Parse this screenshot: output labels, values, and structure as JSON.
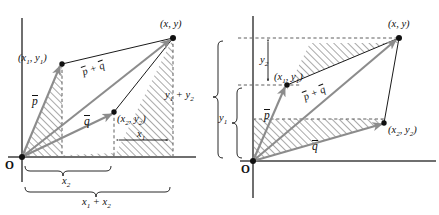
{
  "figure": {
    "type": "vector-addition-diagram",
    "panels": [
      {
        "id": "left",
        "name": "component-sum-x-axis-panel",
        "origin_label": "O",
        "points": [
          {
            "name": "p-head",
            "label_html": "(x<sub>1</sub>, y<sub>1</sub>)",
            "text": "(x1, y1)"
          },
          {
            "name": "q-head",
            "label_html": "(x<sub>2</sub>, y<sub>2</sub>)",
            "text": "(x2, y2)"
          },
          {
            "name": "sum-head",
            "label_html": "(x, y)",
            "text": "(x, y)"
          }
        ],
        "vectors": [
          {
            "name": "vector-p",
            "label": "p",
            "overbar": true
          },
          {
            "name": "vector-q",
            "label": "q",
            "overbar": true
          },
          {
            "name": "vector-p-plus-q",
            "label": "p + q",
            "overbar": true
          }
        ],
        "measures": [
          {
            "name": "measure-x1",
            "label_html": "x<sub>1</sub>",
            "text": "x1",
            "style": "double-arrow"
          },
          {
            "name": "measure-x2",
            "label_html": "x<sub>2</sub>",
            "text": "x2",
            "style": "brace"
          },
          {
            "name": "measure-x1-plus-x2",
            "label_html": "x<sub>1</sub> + x<sub>2</sub>",
            "text": "x1 + x2",
            "style": "brace"
          }
        ]
      },
      {
        "id": "right",
        "name": "component-sum-y-axis-panel",
        "origin_label": "O",
        "points": [
          {
            "name": "p-head",
            "label_html": "(x<sub>1</sub>, y<sub>1</sub>)",
            "text": "(x1, y1)"
          },
          {
            "name": "q-head",
            "label_html": "(x<sub>2</sub>, y<sub>2</sub>)",
            "text": "(x2, y2)"
          },
          {
            "name": "sum-head",
            "label_html": "(x, y)",
            "text": "(x, y)"
          }
        ],
        "vectors": [
          {
            "name": "vector-p",
            "label": "p",
            "overbar": true
          },
          {
            "name": "vector-q",
            "label": "q",
            "overbar": true
          },
          {
            "name": "vector-p-plus-q",
            "label": "p + q",
            "overbar": true
          }
        ],
        "measures": [
          {
            "name": "measure-y2",
            "label_html": "y<sub>2</sub>",
            "text": "y2",
            "style": "double-arrow"
          },
          {
            "name": "measure-y1",
            "label_html": "y<sub>1</sub>",
            "text": "y1",
            "style": "brace"
          },
          {
            "name": "measure-y1-plus-y2",
            "label_html": "y<sub>1</sub> + y<sub>2</sub>",
            "text": "y1 + y2",
            "style": "brace"
          }
        ]
      }
    ],
    "colors": {
      "axis": "#6f6f6f",
      "vector_arrow": "#8c8c8c",
      "outline": "#1a1a1a",
      "hatch": "#5a5a5a",
      "dashed": "#4d4d4d",
      "background": "#ffffff"
    }
  },
  "labels": {
    "origin": "O",
    "left": {
      "p1": "(x",
      "p1b": "1",
      "p1c": ", y",
      "p1d": "1",
      "p1e": ")",
      "xy": "(x, y)",
      "x1": "x",
      "x1s": "1",
      "x2": "x",
      "x2s": "2",
      "x1x2_a": "x",
      "x1x2_b": "1",
      "x1x2_c": " + x",
      "x1x2_d": "2",
      "vec_p": "p",
      "vec_q": "q",
      "vec_pq_a": "p",
      "vec_pq_b": " + ",
      "vec_pq_c": "q"
    },
    "right": {
      "xy": "(x, y)",
      "y2": "y",
      "y2s": "2",
      "y1": "y",
      "y1s": "1",
      "y1y2_a": "y",
      "y1y2_b": "1",
      "y1y2_c": " + y",
      "y1y2_d": "2",
      "vec_p": "p",
      "vec_q": "q",
      "vec_pq_a": "p",
      "vec_pq_b": " + ",
      "vec_pq_c": "q"
    }
  }
}
